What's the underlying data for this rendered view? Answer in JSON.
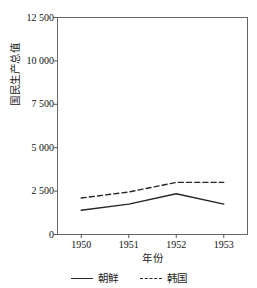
{
  "chart_data": {
    "type": "line",
    "title": "",
    "xlabel": "年份",
    "ylabel": "国民生产总值",
    "x": [
      1950,
      1951,
      1952,
      1953
    ],
    "xtick_labels": [
      "1950",
      "1951",
      "1952",
      "1953"
    ],
    "ytick_labels": [
      "0",
      "2 500",
      "5 000",
      "7 500",
      "10 000",
      "12 500"
    ],
    "ytick_values": [
      0,
      2500,
      5000,
      7500,
      10000,
      12500
    ],
    "ylim": [
      0,
      12500
    ],
    "xlim": [
      1949.5,
      1953.5
    ],
    "grid": false,
    "legend_position": "bottom",
    "series": [
      {
        "name": "朝鲜",
        "style": "solid",
        "color": "#262626",
        "values": [
          1400,
          1750,
          2350,
          1750
        ]
      },
      {
        "name": "韩国",
        "style": "dashed",
        "color": "#262626",
        "values": [
          2100,
          2450,
          3000,
          3000
        ]
      }
    ]
  },
  "legend": {
    "items": [
      {
        "label": "朝鲜",
        "style": "solid"
      },
      {
        "label": "韩国",
        "style": "dashed"
      }
    ]
  },
  "colors": {
    "axis": "#555555",
    "line": "#262626",
    "text": "#1a1a1a",
    "background": "#ffffff"
  }
}
